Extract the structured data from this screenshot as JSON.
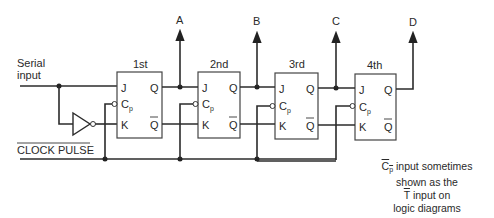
{
  "diagram": {
    "type": "4-bit serial-in parallel-out shift register (JK flip-flops)",
    "inputs": {
      "serial_input_label_line1": "Serial",
      "serial_input_label_line2": "input",
      "clock_label": "CLOCK PULSE"
    },
    "flip_flops": [
      {
        "title": "1st",
        "j": "J",
        "cp": "C",
        "cp_sub": "p",
        "k": "K",
        "q": "Q",
        "qbar": "Q"
      },
      {
        "title": "2nd",
        "j": "J",
        "cp": "C",
        "cp_sub": "p",
        "k": "K",
        "q": "Q",
        "qbar": "Q"
      },
      {
        "title": "3rd",
        "j": "J",
        "cp": "C",
        "cp_sub": "p",
        "k": "K",
        "q": "Q",
        "qbar": "Q"
      },
      {
        "title": "4th",
        "j": "J",
        "cp": "C",
        "cp_sub": "p",
        "k": "K",
        "q": "Q",
        "qbar": "Q"
      }
    ],
    "outputs": [
      "A",
      "B",
      "C",
      "D"
    ],
    "note": {
      "cp": "C",
      "cp_sub": "p",
      "line1_rest": " input sometimes",
      "line2": "shown as the",
      "t": "T",
      "line3_rest": " input on",
      "line4": "logic diagrams"
    },
    "colors": {
      "line": "#2b2b2b",
      "text": "#2a2a2a",
      "background": "#ffffff"
    }
  }
}
